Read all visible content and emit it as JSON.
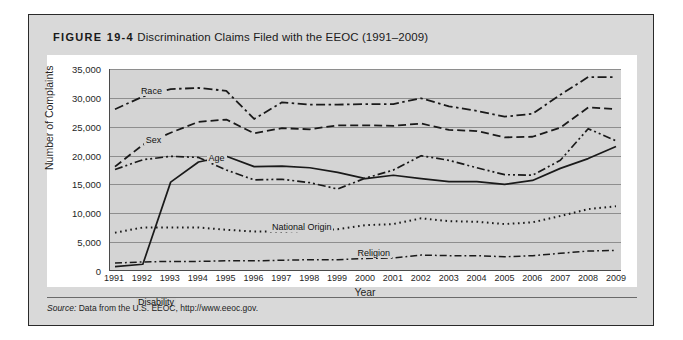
{
  "figure": {
    "number": "FIGURE 19-4",
    "title": "Discrimination Claims Filed with the EEOC (1991–2009)",
    "source": {
      "lead": "Source:",
      "text": " Data from the U.S. EEOC, http://www.eeoc.gov."
    }
  },
  "chart_data": {
    "type": "line",
    "title": "Discrimination Claims Filed with the EEOC (1991–2009)",
    "xlabel": "Year",
    "ylabel": "Number of Complaints",
    "xlim": [
      1991,
      2009
    ],
    "ylim": [
      0,
      35000
    ],
    "yticks": [
      0,
      5000,
      10000,
      15000,
      20000,
      25000,
      30000,
      35000
    ],
    "ytick_labels": [
      "0",
      "5,000",
      "10,000",
      "15,000",
      "20,000",
      "25,000",
      "30,000",
      "35,000"
    ],
    "grid": true,
    "legend": "inline-labels",
    "x": [
      1991,
      1992,
      1993,
      1994,
      1995,
      1996,
      1997,
      1998,
      1999,
      2000,
      2001,
      2002,
      2003,
      2004,
      2005,
      2006,
      2007,
      2008,
      2009
    ],
    "categories": [
      "1991",
      "1992",
      "1993",
      "1994",
      "1995",
      "1996",
      "1997",
      "1998",
      "1999",
      "2000",
      "2001",
      "2002",
      "2003",
      "2004",
      "2005",
      "2006",
      "2007",
      "2008",
      "2009"
    ],
    "series": [
      {
        "name": "Race",
        "label": "Race",
        "style": "dash-dot",
        "values": [
          28000,
          30200,
          31500,
          31700,
          31200,
          26300,
          29200,
          28800,
          28800,
          28900,
          28900,
          29900,
          28500,
          27700,
          26700,
          27200,
          30500,
          33600,
          33600
        ]
      },
      {
        "name": "Sex",
        "label": "Sex",
        "style": "dashed",
        "values": [
          18000,
          21800,
          23900,
          25800,
          26200,
          23800,
          24700,
          24500,
          25200,
          25200,
          25100,
          25500,
          24400,
          24200,
          23100,
          23200,
          24800,
          28300,
          28000
        ]
      },
      {
        "name": "Age",
        "label": "Age",
        "style": "dash-dot-dot",
        "values": [
          17500,
          19200,
          19800,
          19600,
          17400,
          15700,
          15800,
          15200,
          14100,
          16000,
          17400,
          19900,
          19100,
          17800,
          16600,
          16500,
          19100,
          24600,
          22500
        ]
      },
      {
        "name": "Disability",
        "label": "Disability",
        "style": "solid",
        "values": [
          600,
          1000,
          15300,
          18800,
          19800,
          18000,
          18100,
          17800,
          17000,
          15900,
          16500,
          15900,
          15400,
          15400,
          14900,
          15600,
          17700,
          19400,
          21500
        ]
      },
      {
        "name": "National Origin",
        "label": "National Origin",
        "style": "dotted",
        "values": [
          6500,
          7400,
          7400,
          7400,
          7000,
          6700,
          6700,
          6800,
          7100,
          7800,
          8000,
          9000,
          8500,
          8400,
          8000,
          8300,
          9400,
          10600,
          11100
        ]
      },
      {
        "name": "Religion",
        "label": "Religion",
        "style": "dash-dot-thin",
        "values": [
          1200,
          1400,
          1500,
          1500,
          1600,
          1600,
          1700,
          1800,
          1800,
          2000,
          2100,
          2600,
          2500,
          2500,
          2300,
          2500,
          2900,
          3300,
          3400
        ]
      }
    ]
  }
}
